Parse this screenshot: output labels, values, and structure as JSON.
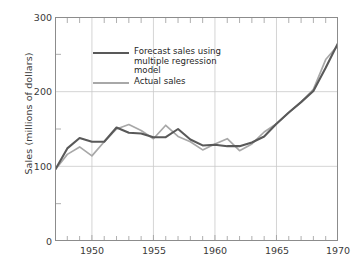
{
  "chart_data": {
    "type": "line",
    "title": "",
    "xlabel": "",
    "ylabel": "Sales (millions of dollars)",
    "xlim": [
      1947,
      1970
    ],
    "ylim": [
      0,
      300
    ],
    "yticks": [
      0,
      100,
      200,
      300
    ],
    "ytick_labels": [
      "0",
      "100",
      "200",
      "300"
    ],
    "xticks": [
      1950,
      1955,
      1960,
      1965,
      1970
    ],
    "xtick_labels": [
      "1950",
      "1955",
      "1960",
      "1965",
      "1970"
    ],
    "minor_xticks_every": 1,
    "grid": "y-major and x-major gridlines, light gray",
    "legend_position": "upper-left inside axes",
    "x": [
      1947,
      1948,
      1949,
      1950,
      1951,
      1952,
      1953,
      1954,
      1955,
      1956,
      1957,
      1958,
      1959,
      1960,
      1961,
      1962,
      1963,
      1964,
      1965,
      1966,
      1967,
      1968,
      1969,
      1970
    ],
    "series": [
      {
        "name": "Forecast sales using multiple regression model",
        "color": "#595959",
        "values": [
          95,
          124,
          138,
          133,
          133,
          152,
          145,
          144,
          139,
          139,
          150,
          136,
          128,
          129,
          127,
          127,
          132,
          140,
          157,
          172,
          186,
          201,
          232,
          265
        ]
      },
      {
        "name": "Actual sales",
        "color": "#a8a8a8",
        "values": [
          95,
          116,
          126,
          114,
          133,
          150,
          156,
          148,
          137,
          155,
          140,
          133,
          122,
          130,
          137,
          121,
          130,
          146,
          157,
          172,
          186,
          203,
          243,
          262
        ]
      }
    ]
  },
  "legend": {
    "items": [
      {
        "label": "Forecast sales using\nmultiple regression model",
        "style": "thick"
      },
      {
        "label": "Actual sales",
        "style": "thin"
      }
    ]
  },
  "axes": {
    "y_title": "Sales (millions of dollars)"
  }
}
